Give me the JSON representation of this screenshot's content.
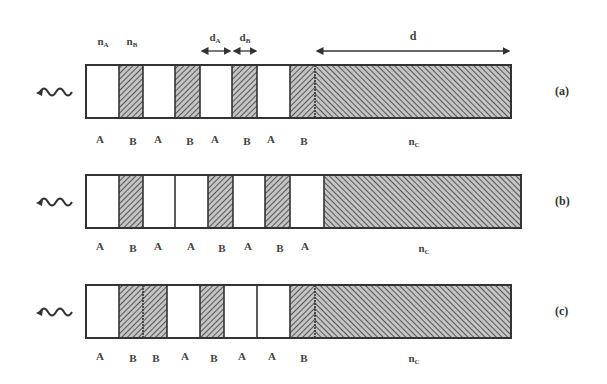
{
  "colors": {
    "outline": "#333333",
    "layer_A_fill": "#ffffff",
    "layer_B_fill": "#bdbdbd",
    "hatch": "#444444"
  },
  "top_labels": {
    "nA": {
      "main": "n",
      "sub": "A"
    },
    "nB": {
      "main": "n",
      "sub": "B"
    },
    "dA": {
      "main": "d",
      "sub": "A"
    },
    "dB": {
      "main": "d",
      "sub": "B"
    },
    "d": "d"
  },
  "panels": [
    {
      "id": "a",
      "label": "(a)",
      "sequence": [
        "A",
        "B",
        "A",
        "B",
        "A",
        "B",
        "A",
        "B"
      ],
      "substrate_label": {
        "main": "n",
        "sub": "C"
      }
    },
    {
      "id": "b",
      "label": "(b)",
      "sequence": [
        "A",
        "B",
        "A",
        "A",
        "B",
        "A",
        "B",
        "A"
      ],
      "substrate_label": {
        "main": "n",
        "sub": "C"
      }
    },
    {
      "id": "c",
      "label": "(c)",
      "sequence": [
        "A",
        "B",
        "B",
        "A",
        "B",
        "A",
        "A",
        "B"
      ],
      "substrate_label": {
        "main": "n",
        "sub": "C"
      }
    }
  ],
  "icons": {
    "incident_wave": "wavy-arrow-left"
  }
}
